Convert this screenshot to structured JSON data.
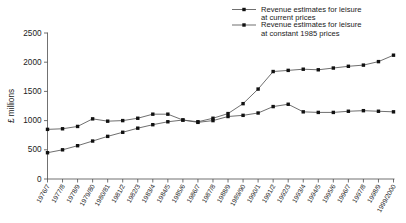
{
  "chart_data": {
    "type": "line",
    "title": "",
    "xlabel": "",
    "ylabel": "£ millions",
    "ylim": [
      0,
      2500
    ],
    "yticks": [
      0,
      500,
      1000,
      1500,
      2000,
      2500
    ],
    "grid": false,
    "legend_position": "top-right",
    "categories": [
      "1976/7",
      "1977/8",
      "1978/9",
      "1979/80",
      "1980/81",
      "1981/2",
      "1982/3",
      "1983/4",
      "1984/5",
      "1985/6",
      "1986/7",
      "1987/8",
      "1988/9",
      "1989/90",
      "1990/1",
      "1991/2",
      "1992/3",
      "1993/4",
      "1994/5",
      "1995/6",
      "1996/7",
      "1997/8",
      "1998/9",
      "1999/2000"
    ],
    "series": [
      {
        "name": "Revenue estimates for leisure at current prices",
        "values": [
          450,
          500,
          570,
          650,
          730,
          800,
          870,
          930,
          980,
          1010,
          980,
          1040,
          1120,
          1290,
          1540,
          1840,
          1860,
          1880,
          1870,
          1900,
          1930,
          1950,
          2010,
          2120
        ]
      },
      {
        "name": "Revenue estimates for leisure at constant 1985 prices",
        "values": [
          850,
          860,
          900,
          1030,
          990,
          1000,
          1040,
          1110,
          1110,
          1010,
          970,
          1000,
          1070,
          1090,
          1130,
          1240,
          1280,
          1150,
          1140,
          1140,
          1160,
          1170,
          1160,
          1150
        ]
      }
    ],
    "legend": [
      {
        "line1": "Revenue estimates for leisure",
        "line2": "at current prices"
      },
      {
        "line1": "Revenue estimates for leisure",
        "line2": "at constant 1985 prices"
      }
    ],
    "colors": {
      "line": "#555555",
      "marker": "#111111",
      "axis": "#4d4d4d",
      "text": "#1a1a1a",
      "background": "#ffffff"
    }
  }
}
